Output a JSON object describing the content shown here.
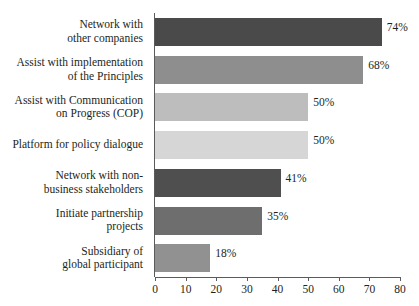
{
  "chart_data": {
    "type": "bar",
    "orientation": "horizontal",
    "title": "",
    "xlabel": "",
    "ylabel": "",
    "xlim": [
      0,
      80
    ],
    "grid": false,
    "legend": "none",
    "xticks": [
      0,
      10,
      20,
      30,
      40,
      50,
      60,
      70,
      80
    ],
    "xtick_labels": [
      "0",
      "10",
      "20",
      "30",
      "40",
      "50",
      "60",
      "70",
      "80"
    ],
    "categories": [
      "Network with other companies",
      "Assist with implementation of the Principles",
      "Assist with Communication on Progress (COP)",
      "Platform for policy dialogue",
      "Network with non-business stakeholders",
      "Initiate partnership projects",
      "Subsidiary of global participant"
    ],
    "category_lines": [
      [
        "Network with",
        "other companies"
      ],
      [
        "Assist with implementation",
        "of the Principles"
      ],
      [
        "Assist with Communication",
        "on Progress (COP)"
      ],
      [
        "Platform for policy dialogue"
      ],
      [
        "Network with non-",
        "business stakeholders"
      ],
      [
        "Initiate partnership",
        "projects"
      ],
      [
        "Subsidiary of",
        "global participant"
      ]
    ],
    "values": [
      74,
      68,
      50,
      50,
      41,
      35,
      18
    ],
    "value_labels": [
      "74%",
      "68%",
      "50%",
      "50%",
      "41%",
      "35%",
      "18%"
    ],
    "bar_colors": [
      "#4a4a4a",
      "#8e8e8e",
      "#bdbdbd",
      "#d6d6d6",
      "#4f4f4f",
      "#6e6e6e",
      "#919191"
    ],
    "axis_color": "#5b5b5b",
    "text_color": "#231f20",
    "background": "#ffffff"
  }
}
